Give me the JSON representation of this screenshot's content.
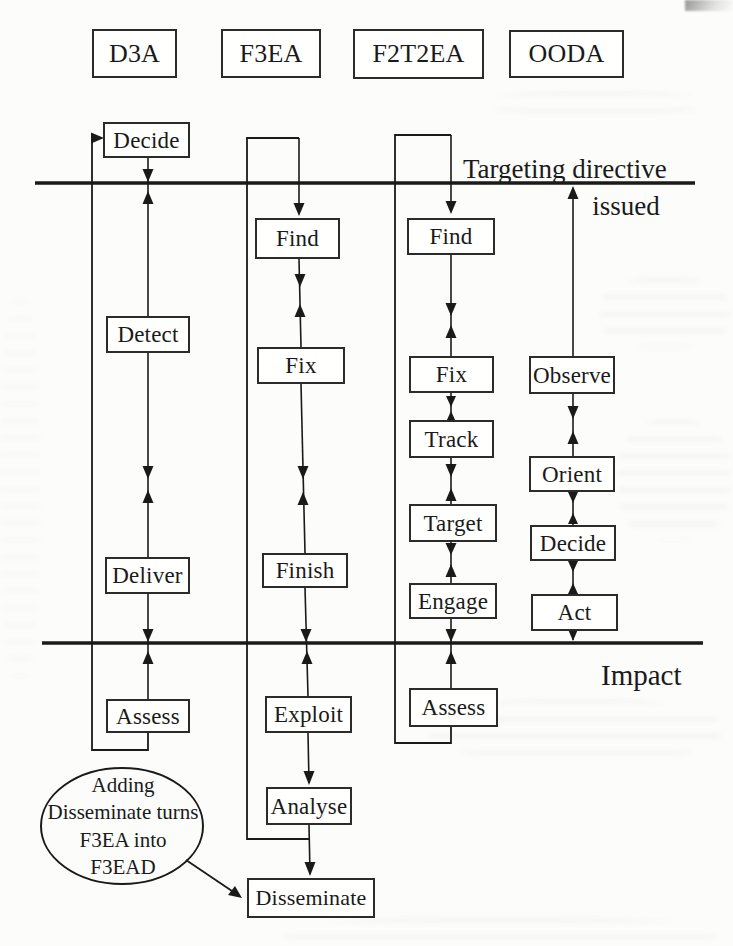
{
  "headers": [
    {
      "label": "D3A"
    },
    {
      "label": "F3EA"
    },
    {
      "label": "F2T2EA"
    },
    {
      "label": "OODA"
    }
  ],
  "columns": {
    "d3a": {
      "steps": [
        "Decide",
        "Detect",
        "Deliver",
        "Assess"
      ]
    },
    "f3ea": {
      "steps": [
        "Find",
        "Fix",
        "Finish",
        "Exploit",
        "Analyse",
        "Disseminate"
      ]
    },
    "f2t2ea": {
      "steps": [
        "Find",
        "Fix",
        "Track",
        "Target",
        "Engage",
        "Assess"
      ]
    },
    "ooda": {
      "steps": [
        "Observe",
        "Orient",
        "Decide",
        "Act"
      ]
    }
  },
  "phase_lines": {
    "targeting": {
      "line1": "Targeting directive",
      "line2": "issued"
    },
    "impact": {
      "label": "Impact"
    }
  },
  "annotation": {
    "lines": [
      "Adding",
      "Disseminate turns",
      "F3EA into",
      "F3EAD"
    ]
  },
  "colors": {
    "ink": "#1a1a1a",
    "box_border": "#2b2b2b",
    "paper": "#fcfcfa"
  }
}
